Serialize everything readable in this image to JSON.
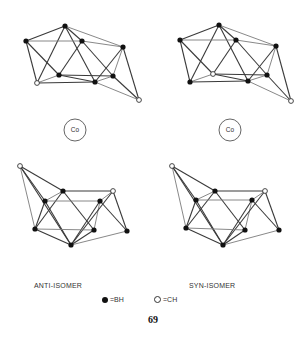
{
  "figure": {
    "page_number": "69",
    "labels": {
      "anti": "ANTI-ISOMER",
      "syn": "SYN-ISOMER"
    },
    "legend": {
      "filled": "=BH",
      "open": "=CH"
    },
    "metal_label": "Co"
  },
  "structures": [
    {
      "id": "anti-top",
      "nodes": [
        {
          "x": 65,
          "y": 26,
          "type": "BH"
        },
        {
          "x": 26,
          "y": 41,
          "type": "BH"
        },
        {
          "x": 82,
          "y": 41,
          "type": "BH"
        },
        {
          "x": 123,
          "y": 47,
          "type": "BH"
        },
        {
          "x": 59,
          "y": 75,
          "type": "BH"
        },
        {
          "x": 113,
          "y": 76,
          "type": "BH"
        },
        {
          "x": 37,
          "y": 83,
          "type": "CH"
        },
        {
          "x": 95,
          "y": 82,
          "type": "BH"
        },
        {
          "x": 139,
          "y": 100,
          "type": "CH"
        }
      ],
      "bonds": [
        [
          0,
          1
        ],
        [
          0,
          2
        ],
        [
          0,
          3
        ],
        [
          0,
          6
        ],
        [
          0,
          7
        ],
        [
          1,
          2
        ],
        [
          1,
          6
        ],
        [
          1,
          4
        ],
        [
          2,
          3
        ],
        [
          2,
          4
        ],
        [
          2,
          5
        ],
        [
          3,
          5
        ],
        [
          3,
          7
        ],
        [
          3,
          8
        ],
        [
          4,
          6
        ],
        [
          4,
          7
        ],
        [
          4,
          5
        ],
        [
          5,
          7
        ],
        [
          5,
          8
        ],
        [
          6,
          7
        ],
        [
          7,
          8
        ]
      ]
    },
    {
      "id": "syn-top",
      "nodes": [
        {
          "x": 219,
          "y": 25,
          "type": "BH"
        },
        {
          "x": 180,
          "y": 40,
          "type": "BH"
        },
        {
          "x": 236,
          "y": 40,
          "type": "BH"
        },
        {
          "x": 276,
          "y": 46,
          "type": "BH"
        },
        {
          "x": 213,
          "y": 74,
          "type": "CH"
        },
        {
          "x": 267,
          "y": 75,
          "type": "BH"
        },
        {
          "x": 190,
          "y": 82,
          "type": "BH"
        },
        {
          "x": 248,
          "y": 81,
          "type": "BH"
        },
        {
          "x": 291,
          "y": 101,
          "type": "CH"
        }
      ],
      "bonds": [
        [
          0,
          1
        ],
        [
          0,
          2
        ],
        [
          0,
          3
        ],
        [
          0,
          6
        ],
        [
          0,
          7
        ],
        [
          1,
          2
        ],
        [
          1,
          6
        ],
        [
          1,
          4
        ],
        [
          2,
          3
        ],
        [
          2,
          4
        ],
        [
          2,
          5
        ],
        [
          3,
          5
        ],
        [
          3,
          7
        ],
        [
          3,
          8
        ],
        [
          4,
          6
        ],
        [
          4,
          7
        ],
        [
          4,
          5
        ],
        [
          5,
          7
        ],
        [
          5,
          8
        ],
        [
          6,
          7
        ],
        [
          7,
          8
        ]
      ]
    },
    {
      "id": "anti-bottom",
      "nodes": [
        {
          "x": 20,
          "y": 166,
          "type": "CH"
        },
        {
          "x": 63,
          "y": 191,
          "type": "BH"
        },
        {
          "x": 45,
          "y": 201,
          "type": "BH"
        },
        {
          "x": 100,
          "y": 201,
          "type": "BH"
        },
        {
          "x": 113,
          "y": 191,
          "type": "CH"
        },
        {
          "x": 35,
          "y": 229,
          "type": "BH"
        },
        {
          "x": 94,
          "y": 230,
          "type": "BH"
        },
        {
          "x": 127,
          "y": 231,
          "type": "BH"
        },
        {
          "x": 71,
          "y": 245,
          "type": "BH"
        }
      ],
      "bonds": [
        [
          0,
          1
        ],
        [
          0,
          2
        ],
        [
          0,
          5
        ],
        [
          0,
          8
        ],
        [
          1,
          4
        ],
        [
          1,
          2
        ],
        [
          1,
          6
        ],
        [
          1,
          5
        ],
        [
          2,
          3
        ],
        [
          2,
          5
        ],
        [
          2,
          8
        ],
        [
          3,
          4
        ],
        [
          3,
          8
        ],
        [
          3,
          7
        ],
        [
          3,
          6
        ],
        [
          4,
          7
        ],
        [
          4,
          8
        ],
        [
          5,
          6
        ],
        [
          5,
          8
        ],
        [
          6,
          8
        ],
        [
          7,
          8
        ]
      ]
    },
    {
      "id": "syn-bottom",
      "nodes": [
        {
          "x": 172,
          "y": 166,
          "type": "CH"
        },
        {
          "x": 215,
          "y": 191,
          "type": "BH"
        },
        {
          "x": 196,
          "y": 200,
          "type": "BH"
        },
        {
          "x": 252,
          "y": 200,
          "type": "BH"
        },
        {
          "x": 265,
          "y": 191,
          "type": "CH"
        },
        {
          "x": 186,
          "y": 228,
          "type": "BH"
        },
        {
          "x": 245,
          "y": 230,
          "type": "BH"
        },
        {
          "x": 279,
          "y": 230,
          "type": "BH"
        },
        {
          "x": 223,
          "y": 245,
          "type": "BH"
        }
      ],
      "bonds": [
        [
          0,
          1
        ],
        [
          0,
          2
        ],
        [
          0,
          5
        ],
        [
          0,
          8
        ],
        [
          1,
          4
        ],
        [
          1,
          2
        ],
        [
          1,
          6
        ],
        [
          1,
          5
        ],
        [
          2,
          3
        ],
        [
          2,
          5
        ],
        [
          2,
          8
        ],
        [
          3,
          4
        ],
        [
          3,
          8
        ],
        [
          3,
          7
        ],
        [
          3,
          6
        ],
        [
          4,
          7
        ],
        [
          4,
          8
        ],
        [
          5,
          6
        ],
        [
          5,
          8
        ],
        [
          6,
          8
        ],
        [
          7,
          8
        ]
      ]
    }
  ],
  "metals": [
    {
      "id": "co-left",
      "x": 75,
      "y": 130,
      "r": 11
    },
    {
      "id": "co-right",
      "x": 230,
      "y": 130,
      "r": 11
    }
  ]
}
